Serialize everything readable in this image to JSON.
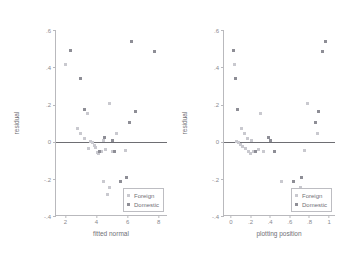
{
  "figure": {
    "background_color": "#ffffff",
    "axis_color": "#b9b9bd",
    "zero_line_color": "#6e6e73",
    "foreign_color": "#c9c9cf",
    "domestic_color": "#8e8e96"
  },
  "legend": {
    "foreign_label": "Foreign",
    "domestic_label": "Domestic"
  },
  "chart_data": [
    {
      "type": "scatter",
      "title": "",
      "xlabel": "fitted normal",
      "ylabel": "residual",
      "xlim": [
        1.4,
        8.6
      ],
      "ylim": [
        -0.4,
        0.6
      ],
      "xticks": [
        2,
        4,
        6,
        8
      ],
      "xticklabels": [
        "2",
        "4",
        "6",
        "8"
      ],
      "yticks": [
        0.6,
        0.4,
        0.2,
        0,
        -0.2,
        -0.4
      ],
      "yticklabels": [
        ".6",
        ".4",
        ".2",
        "0",
        "-.2",
        "-.4"
      ],
      "grid": false,
      "reference_line_y": 0,
      "legend_position": "lower right",
      "series": [
        {
          "name": "Foreign",
          "color": "#c9c9cf",
          "points": [
            [
              2.0,
              0.415
            ],
            [
              2.75,
              0.072
            ],
            [
              3.0,
              0.045
            ],
            [
              3.25,
              0.015
            ],
            [
              3.5,
              -0.035
            ],
            [
              3.6,
              0.0
            ],
            [
              3.75,
              -0.005
            ],
            [
              3.85,
              -0.02
            ],
            [
              3.95,
              -0.03
            ],
            [
              4.05,
              -0.06
            ],
            [
              4.1,
              -0.065
            ],
            [
              4.3,
              -0.055
            ],
            [
              4.45,
              0.005
            ],
            [
              4.6,
              -0.04
            ],
            [
              4.85,
              0.205
            ],
            [
              5.0,
              -0.055
            ],
            [
              5.3,
              0.045
            ],
            [
              4.45,
              -0.215
            ],
            [
              4.85,
              -0.245
            ],
            [
              4.7,
              -0.285
            ],
            [
              3.4,
              0.15
            ],
            [
              5.85,
              -0.05
            ]
          ]
        },
        {
          "name": "Domestic",
          "color": "#8e8e96",
          "points": [
            [
              2.35,
              0.49
            ],
            [
              2.95,
              0.34
            ],
            [
              3.2,
              0.17
            ],
            [
              4.2,
              -0.055
            ],
            [
              4.5,
              0.02
            ],
            [
              5.0,
              0.005
            ],
            [
              5.15,
              -0.055
            ],
            [
              5.55,
              -0.215
            ],
            [
              5.9,
              -0.195
            ],
            [
              6.15,
              0.105
            ],
            [
              6.25,
              0.54
            ],
            [
              6.5,
              0.16
            ],
            [
              7.75,
              0.485
            ]
          ]
        }
      ]
    },
    {
      "type": "scatter",
      "title": "",
      "xlabel": "plotting position",
      "ylabel": "residual",
      "xlim": [
        -0.07,
        1.07
      ],
      "ylim": [
        -0.4,
        0.6
      ],
      "xticks": [
        0,
        0.2,
        0.4,
        0.6,
        0.8,
        1
      ],
      "xticklabels": [
        "0",
        ".2",
        ".4",
        ".6",
        ".8",
        "1"
      ],
      "yticks": [
        0.6,
        0.4,
        0.2,
        0,
        -0.2,
        -0.4
      ],
      "yticklabels": [
        ".6",
        ".4",
        ".2",
        "0",
        "-.2",
        "-.4"
      ],
      "grid": false,
      "reference_line_y": 0,
      "legend_position": "lower right",
      "series": [
        {
          "name": "Foreign",
          "color": "#c9c9cf",
          "points": [
            [
              0.04,
              0.415
            ],
            [
              0.11,
              0.072
            ],
            [
              0.14,
              0.045
            ],
            [
              0.17,
              0.015
            ],
            [
              0.06,
              0.0
            ],
            [
              0.08,
              -0.005
            ],
            [
              0.1,
              -0.015
            ],
            [
              0.12,
              -0.025
            ],
            [
              0.15,
              -0.035
            ],
            [
              0.18,
              -0.055
            ],
            [
              0.2,
              -0.065
            ],
            [
              0.23,
              -0.055
            ],
            [
              0.21,
              0.005
            ],
            [
              0.28,
              -0.04
            ],
            [
              0.78,
              0.205
            ],
            [
              0.33,
              -0.055
            ],
            [
              0.88,
              0.045
            ],
            [
              0.52,
              -0.215
            ],
            [
              0.71,
              -0.245
            ],
            [
              0.72,
              -0.285
            ],
            [
              0.3,
              0.15
            ],
            [
              0.75,
              -0.05
            ]
          ]
        },
        {
          "name": "Domestic",
          "color": "#8e8e96",
          "points": [
            [
              0.03,
              0.49
            ],
            [
              0.05,
              0.34
            ],
            [
              0.07,
              0.17
            ],
            [
              0.25,
              -0.055
            ],
            [
              0.38,
              0.02
            ],
            [
              0.4,
              0.005
            ],
            [
              0.44,
              -0.055
            ],
            [
              0.64,
              -0.215
            ],
            [
              0.72,
              -0.195
            ],
            [
              0.86,
              0.105
            ],
            [
              0.96,
              0.54
            ],
            [
              0.89,
              0.16
            ],
            [
              0.93,
              0.485
            ]
          ]
        }
      ]
    }
  ]
}
